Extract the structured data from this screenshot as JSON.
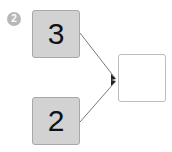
{
  "step_badge": {
    "label": "2",
    "color": "#b8b8b8"
  },
  "boxes": [
    {
      "id": "top-input",
      "value": "3"
    },
    {
      "id": "bottom-input",
      "value": "2"
    },
    {
      "id": "answer",
      "value": ""
    }
  ],
  "colors": {
    "filled_box": "#d2d2d2",
    "empty_box": "#ffffff",
    "arrow": "#444444"
  }
}
